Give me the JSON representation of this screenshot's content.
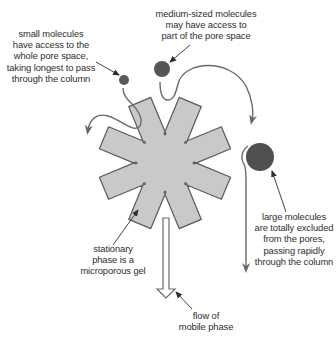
{
  "colors": {
    "gel_fill": "#c9c9c9",
    "gel_stroke": "#5a5a5a",
    "path_stroke": "#6a6a6a",
    "small_molecule": "#5a5a5a",
    "medium_molecule": "#555555",
    "large_molecule": "#505050",
    "text": "#2e2e2e",
    "background": "#ffffff"
  },
  "labels": {
    "small_molecules": {
      "lines": [
        "small molecules",
        "have access to the",
        "whole pore space,",
        "taking longest to pass",
        "through the column"
      ]
    },
    "medium_molecules": {
      "lines": [
        "medium-sized molecules",
        "may have access to",
        "part of the pore space"
      ]
    },
    "large_molecules": {
      "lines": [
        "large molecules",
        "are totally excluded",
        "from the pores,",
        "passing rapidly",
        "through the column"
      ]
    },
    "stationary_phase": {
      "lines": [
        "stationary",
        "phase is a",
        "microporous gel"
      ]
    },
    "mobile_phase": {
      "lines": [
        "flow of",
        "mobile phase"
      ]
    }
  },
  "elements": {
    "gel_particle": {
      "shape": "eight-armed-star",
      "center": [
        165,
        163
      ]
    },
    "small_molecule": {
      "center": [
        124,
        78
      ],
      "radius": 5
    },
    "medium_molecule": {
      "center": [
        162,
        68
      ],
      "radius": 8
    },
    "large_molecule": {
      "center": [
        260,
        156
      ],
      "radius": 14
    },
    "flow_arrow": {
      "direction": "down",
      "x": 166,
      "y_start": 218,
      "y_end": 298
    }
  }
}
